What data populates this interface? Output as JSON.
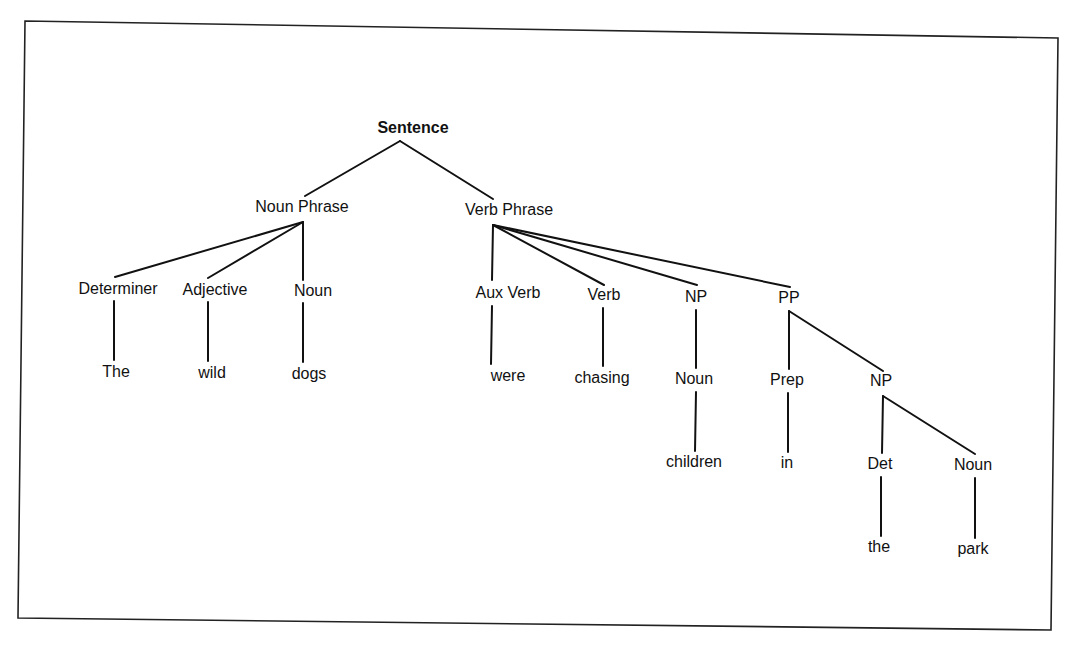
{
  "diagram": {
    "type": "parse-tree",
    "frame": {
      "points": [
        [
          25,
          21
        ],
        [
          1058,
          38
        ],
        [
          1051,
          630
        ],
        [
          18,
          618
        ]
      ]
    },
    "nodes": [
      {
        "id": "sentence",
        "label": "Sentence",
        "x": 413,
        "y": 129,
        "bold": true
      },
      {
        "id": "np",
        "label": "Noun Phrase",
        "x": 302,
        "y": 208
      },
      {
        "id": "vp",
        "label": "Verb Phrase",
        "x": 509,
        "y": 211
      },
      {
        "id": "det",
        "label": "Determiner",
        "x": 118,
        "y": 290
      },
      {
        "id": "adj",
        "label": "Adjective",
        "x": 215,
        "y": 291
      },
      {
        "id": "noun1",
        "label": "Noun",
        "x": 313,
        "y": 292
      },
      {
        "id": "aux",
        "label": "Aux Verb",
        "x": 508,
        "y": 294
      },
      {
        "id": "verb",
        "label": "Verb",
        "x": 604,
        "y": 296
      },
      {
        "id": "np2",
        "label": "NP",
        "x": 696,
        "y": 298
      },
      {
        "id": "pp",
        "label": "PP",
        "x": 789,
        "y": 299
      },
      {
        "id": "the1",
        "label": "The",
        "x": 116,
        "y": 373
      },
      {
        "id": "wild",
        "label": "wild",
        "x": 212,
        "y": 374
      },
      {
        "id": "dogs",
        "label": "dogs",
        "x": 309,
        "y": 375
      },
      {
        "id": "were",
        "label": "were",
        "x": 508,
        "y": 377
      },
      {
        "id": "chasing",
        "label": "chasing",
        "x": 602,
        "y": 379
      },
      {
        "id": "noun2",
        "label": "Noun",
        "x": 694,
        "y": 380
      },
      {
        "id": "prep",
        "label": "Prep",
        "x": 787,
        "y": 381
      },
      {
        "id": "np3",
        "label": "NP",
        "x": 881,
        "y": 382
      },
      {
        "id": "children",
        "label": "children",
        "x": 694,
        "y": 463
      },
      {
        "id": "in",
        "label": "in",
        "x": 787,
        "y": 464
      },
      {
        "id": "det2",
        "label": "Det",
        "x": 880,
        "y": 465
      },
      {
        "id": "noun3",
        "label": "Noun",
        "x": 973,
        "y": 466
      },
      {
        "id": "the2",
        "label": "the",
        "x": 879,
        "y": 548
      },
      {
        "id": "park",
        "label": "park",
        "x": 973,
        "y": 550
      }
    ],
    "edges": [
      {
        "from": "sentence",
        "to": "np",
        "x1": 400,
        "y1": 141,
        "x2": 305,
        "y2": 196
      },
      {
        "from": "sentence",
        "to": "vp",
        "x1": 400,
        "y1": 141,
        "x2": 493,
        "y2": 199
      },
      {
        "from": "np",
        "to": "det",
        "x1": 303,
        "y1": 222,
        "x2": 115,
        "y2": 277
      },
      {
        "from": "np",
        "to": "adj",
        "x1": 303,
        "y1": 222,
        "x2": 208,
        "y2": 278
      },
      {
        "from": "np",
        "to": "noun1",
        "x1": 303,
        "y1": 222,
        "x2": 303,
        "y2": 280
      },
      {
        "from": "vp",
        "to": "aux",
        "x1": 493,
        "y1": 225,
        "x2": 492,
        "y2": 280
      },
      {
        "from": "vp",
        "to": "verb",
        "x1": 493,
        "y1": 225,
        "x2": 604,
        "y2": 285
      },
      {
        "from": "vp",
        "to": "np2",
        "x1": 493,
        "y1": 225,
        "x2": 697,
        "y2": 285
      },
      {
        "from": "vp",
        "to": "pp",
        "x1": 493,
        "y1": 225,
        "x2": 790,
        "y2": 287
      },
      {
        "from": "det",
        "to": "the1",
        "x1": 114,
        "y1": 301,
        "x2": 114,
        "y2": 360
      },
      {
        "from": "adj",
        "to": "wild",
        "x1": 208,
        "y1": 302,
        "x2": 208,
        "y2": 361
      },
      {
        "from": "noun1",
        "to": "dogs",
        "x1": 303,
        "y1": 303,
        "x2": 303,
        "y2": 362
      },
      {
        "from": "aux",
        "to": "were",
        "x1": 492,
        "y1": 306,
        "x2": 491,
        "y2": 364
      },
      {
        "from": "verb",
        "to": "chasing",
        "x1": 603,
        "y1": 308,
        "x2": 603,
        "y2": 366
      },
      {
        "from": "np2",
        "to": "noun2",
        "x1": 696,
        "y1": 310,
        "x2": 696,
        "y2": 368
      },
      {
        "from": "pp",
        "to": "prep",
        "x1": 789,
        "y1": 311,
        "x2": 789,
        "y2": 369
      },
      {
        "from": "pp",
        "to": "np3",
        "x1": 789,
        "y1": 311,
        "x2": 883,
        "y2": 371
      },
      {
        "from": "noun2",
        "to": "children",
        "x1": 696,
        "y1": 392,
        "x2": 695,
        "y2": 451
      },
      {
        "from": "prep",
        "to": "in",
        "x1": 788,
        "y1": 393,
        "x2": 788,
        "y2": 452
      },
      {
        "from": "np3",
        "to": "det2",
        "x1": 883,
        "y1": 396,
        "x2": 882,
        "y2": 453
      },
      {
        "from": "np3",
        "to": "noun3",
        "x1": 883,
        "y1": 396,
        "x2": 975,
        "y2": 454
      },
      {
        "from": "det2",
        "to": "the2",
        "x1": 881,
        "y1": 477,
        "x2": 881,
        "y2": 536
      },
      {
        "from": "noun3",
        "to": "park",
        "x1": 975,
        "y1": 478,
        "x2": 975,
        "y2": 538
      }
    ]
  }
}
